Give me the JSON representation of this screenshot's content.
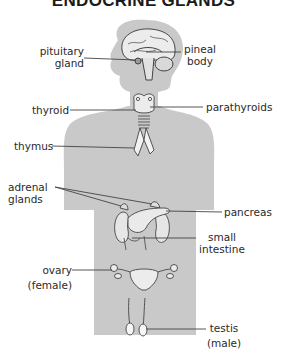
{
  "title": "ENDOCRINE GLANDS",
  "colors": {
    "silhouette": "#c9c9c9",
    "organ_fill": "#ececec",
    "line": "#444444",
    "text": "#2a2a2a"
  },
  "labels": {
    "pituitary": [
      "pituitary",
      "gland"
    ],
    "pineal": [
      "pineal",
      "body"
    ],
    "thyroid": "thyroid",
    "parathyroids": "parathyroids",
    "thymus": "thymus",
    "adrenal": [
      "adrenal",
      "glands"
    ],
    "pancreas": "pancreas",
    "small_intestine": [
      "small",
      "intestine"
    ],
    "ovary": [
      "ovary",
      "(female)"
    ],
    "testis": [
      "testis",
      "(male)"
    ]
  }
}
